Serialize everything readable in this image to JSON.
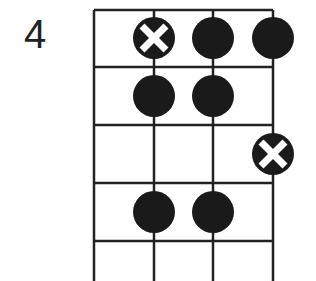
{
  "diagram": {
    "type": "fretboard-pattern",
    "fret_label": "4",
    "strings": 4,
    "frets_visible": 5,
    "colors": {
      "line": "#222222",
      "dot": "#1a1a1a",
      "x_mark": "#ffffff",
      "background": "#ffffff"
    },
    "markers": [
      {
        "fret_row": 1,
        "string": 2,
        "kind": "root-x"
      },
      {
        "fret_row": 1,
        "string": 3,
        "kind": "dot"
      },
      {
        "fret_row": 1,
        "string": 4,
        "kind": "dot"
      },
      {
        "fret_row": 2,
        "string": 2,
        "kind": "dot"
      },
      {
        "fret_row": 2,
        "string": 3,
        "kind": "dot"
      },
      {
        "fret_row": 3,
        "string": 4,
        "kind": "root-x"
      },
      {
        "fret_row": 4,
        "string": 2,
        "kind": "dot"
      },
      {
        "fret_row": 4,
        "string": 3,
        "kind": "dot"
      }
    ]
  }
}
